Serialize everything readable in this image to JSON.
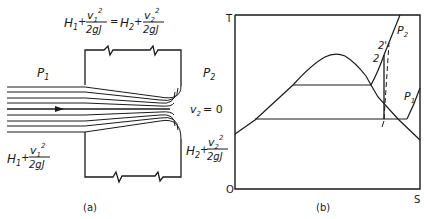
{
  "panel_a": {
    "caption": "(a)",
    "equation_top": {
      "lhs_H": "H",
      "lhs_H_sub": "1",
      "plus1": "+",
      "frac1_num_v": "v",
      "frac1_num_sub": "1",
      "frac1_num_sup": "2",
      "frac1_den": "2gJ",
      "equals": "=",
      "rhs_H": "H",
      "rhs_H_sub": "2",
      "plus2": "+",
      "frac2_num_v": "v",
      "frac2_num_sub": "2",
      "frac2_num_sup": "2",
      "frac2_den": "2gJ"
    },
    "inlet_pressure": {
      "P": "P",
      "sub": "1"
    },
    "outlet_pressure": {
      "P": "P",
      "sub": "2"
    },
    "stagnation_velocity": {
      "v": "v",
      "sub": "2",
      "rest": "= 0"
    },
    "inlet_energy": {
      "H": "H",
      "H_sub": "1",
      "plus": "+",
      "num_v": "v",
      "num_sub": "1",
      "num_sup": "2",
      "den": "2gJ"
    },
    "outlet_energy": {
      "H": "H",
      "H_sub": "2",
      "plus": "+",
      "num_v": "v",
      "num_sub": "2",
      "num_sup": "2",
      "den": "2gJ"
    }
  },
  "panel_b": {
    "caption": "(b)",
    "y_axis_label": "T",
    "x_axis_label": "S",
    "origin_label": "O",
    "isobar_high": {
      "P": "P",
      "sub": "2"
    },
    "isobar_low": {
      "P": "P",
      "sub": "1"
    },
    "state_1": "1",
    "state_2": "2",
    "state_2_prime": "2'"
  }
}
